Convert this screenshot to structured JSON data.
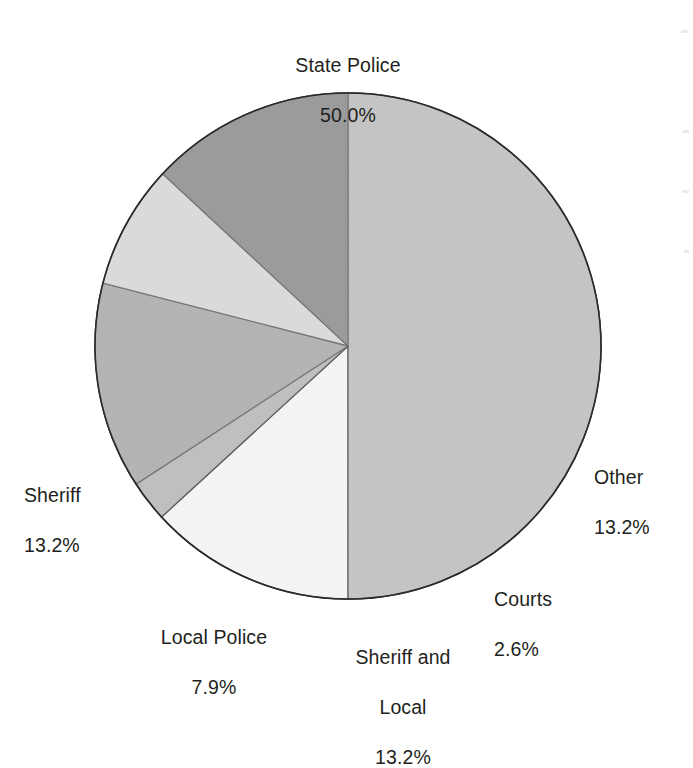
{
  "chart_data": {
    "type": "pie",
    "title": "",
    "subtitle": "",
    "xlabel": "",
    "ylabel": "",
    "legend_position": "none",
    "grid": false,
    "value_unit": "%",
    "start_angle_deg": 0,
    "direction": "clockwise",
    "center": {
      "x": 348,
      "y": 346
    },
    "radius": 253,
    "categories": [
      "State Police",
      "Other",
      "Courts",
      "Sheriff and Local",
      "Local Police",
      "Sheriff"
    ],
    "values": [
      50.0,
      13.2,
      2.6,
      13.2,
      7.9,
      13.2
    ],
    "slices": [
      {
        "label": "State Police",
        "label_line1": "State Police",
        "value": 50.0,
        "value_text": "50.0%",
        "color": "#a3a3a3",
        "start_deg": 0,
        "end_deg": 180
      },
      {
        "label": "Other",
        "label_line1": "Other",
        "value": 13.2,
        "value_text": "13.2%",
        "color": "#f4f4f4",
        "start_deg": 180,
        "end_deg": 227.5
      },
      {
        "label": "Courts",
        "label_line1": "Courts",
        "value": 2.6,
        "value_text": "2.6%",
        "color": "#9a9a9a",
        "start_deg": 227.5,
        "end_deg": 236.9
      },
      {
        "label": "Sheriff and Local",
        "label_line1": "Sheriff and",
        "label_line2": "Local",
        "value": 13.2,
        "value_text": "13.2%",
        "color": "#878787",
        "start_deg": 236.9,
        "end_deg": 284.4
      },
      {
        "label": "Local Police",
        "label_line1": "Local Police",
        "value": 7.9,
        "value_text": "7.9%",
        "color": "#c9c9c9",
        "start_deg": 284.4,
        "end_deg": 312.9
      },
      {
        "label": "Sheriff",
        "label_line1": "Sheriff",
        "value": 13.2,
        "value_text": "13.2%",
        "color": "#5c5c5c",
        "start_deg": 312.9,
        "end_deg": 360
      }
    ],
    "outline_color": "#2b2b2b",
    "background_color": "#ffffff"
  }
}
